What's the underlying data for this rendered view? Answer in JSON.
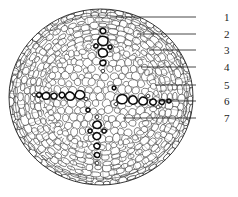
{
  "figure": {
    "type": "botanical-cross-section-diagram",
    "background_color": "#ffffff",
    "line_color": "#1a1a1a",
    "specimen": {
      "shape": "oval",
      "center_x": 101,
      "center_y": 97,
      "radius_x": 93,
      "radius_y": 89
    },
    "regions": [
      {
        "name": "epidermis",
        "description": "outer single cell layer"
      },
      {
        "name": "cortex",
        "description": "radially arranged parenchyma cells"
      },
      {
        "name": "endodermis",
        "description": "inner boundary layer"
      },
      {
        "name": "pith",
        "description": "central rounded parenchyma"
      },
      {
        "name": "xylem-vessels",
        "description": "large thick dark walled cells"
      }
    ]
  },
  "labels": [
    {
      "id": "1",
      "text": "1",
      "text_x": 224,
      "text_y": 12,
      "line_x1": 196,
      "line_y1": 17,
      "line_x2": 110,
      "line_y2": 17
    },
    {
      "id": "2",
      "text": "2",
      "text_x": 224,
      "text_y": 29,
      "line_x1": 196,
      "line_y1": 34,
      "line_x2": 137,
      "line_y2": 34
    },
    {
      "id": "3",
      "text": "3",
      "text_x": 224,
      "text_y": 45,
      "line_x1": 196,
      "line_y1": 50,
      "line_x2": 149,
      "line_y2": 50
    },
    {
      "id": "4",
      "text": "4",
      "text_x": 224,
      "text_y": 62,
      "line_x1": 196,
      "line_y1": 67,
      "line_x2": 141,
      "line_y2": 67
    },
    {
      "id": "5",
      "text": "5",
      "text_x": 224,
      "text_y": 80,
      "line_x1": 196,
      "line_y1": 85,
      "line_x2": 155,
      "line_y2": 85
    },
    {
      "id": "6",
      "text": "6",
      "text_x": 224,
      "text_y": 96,
      "line_x1": 196,
      "line_y1": 101,
      "line_x2": 160,
      "line_y2": 101
    },
    {
      "id": "7",
      "text": "7",
      "text_x": 224,
      "text_y": 113,
      "line_x1": 196,
      "line_y1": 118,
      "line_x2": 123,
      "line_y2": 118
    }
  ]
}
